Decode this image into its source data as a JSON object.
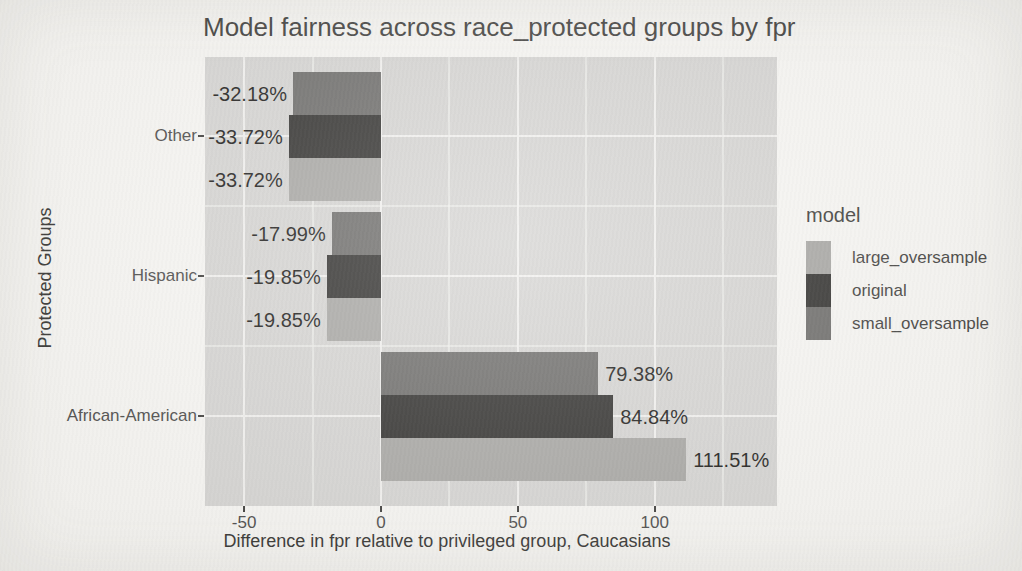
{
  "colors": {
    "background": "#f7f6f3",
    "panel_background": "#d5d4d2",
    "grid_major": "#f1f0ee",
    "grid_minor": "rgba(241,240,238,0.62)",
    "tick_mark": "#3c3b39",
    "axis_text": "#4a4948"
  },
  "chart_data": {
    "type": "bar",
    "orientation": "horizontal",
    "title": "Model fairness across race_protected groups by fpr",
    "xlabel": "Difference in fpr relative to privileged group, Caucasians",
    "ylabel": "Protected Groups",
    "categories": [
      "Other",
      "Hispanic",
      "African-American"
    ],
    "series": [
      {
        "name": "small_oversample",
        "color": "#6c6b69",
        "values": [
          -32.18,
          -17.99,
          79.38
        ],
        "labels": [
          "-32.18%",
          "-17.99%",
          "79.38%"
        ]
      },
      {
        "name": "original",
        "color": "#302f2d",
        "values": [
          -33.72,
          -19.85,
          84.84
        ],
        "labels": [
          "-33.72%",
          "-19.85%",
          "84.84%"
        ]
      },
      {
        "name": "large_oversample",
        "color": "#a7a6a3",
        "values": [
          -33.72,
          -19.85,
          111.51
        ],
        "labels": [
          "-33.72%",
          "-19.85%",
          "111.51%"
        ]
      }
    ],
    "x_ticks": [
      -50,
      0,
      50,
      100
    ],
    "x_tick_labels": [
      "-50",
      "0",
      "50",
      "100"
    ],
    "x_minor_ticks": [
      -25,
      25,
      75,
      125
    ],
    "xlim": [
      -64.3,
      144.7
    ],
    "grid": true,
    "legend": {
      "title": "model",
      "position": "right",
      "entries": [
        "large_oversample",
        "original",
        "small_oversample"
      ]
    }
  }
}
